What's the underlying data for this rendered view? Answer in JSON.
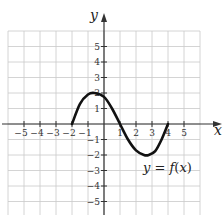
{
  "chart_data": {
    "type": "line",
    "title": "",
    "xlabel": "x",
    "ylabel": "y",
    "xlim": [
      -6,
      6
    ],
    "ylim": [
      -6,
      6
    ],
    "grid": true,
    "x_ticks": [
      -5,
      -4,
      -3,
      -2,
      -1,
      1,
      2,
      3,
      4,
      5
    ],
    "y_ticks": [
      5,
      4,
      3,
      2,
      1,
      -1,
      -2,
      -3,
      -4,
      -5
    ],
    "x_tick_labels": [
      "−5",
      "−4",
      "−3",
      "−2",
      "−1",
      "1",
      "2",
      "3",
      "4",
      "5"
    ],
    "y_tick_labels": [
      "5",
      "4",
      "3",
      "2",
      "1",
      "−1",
      "−2",
      "−3",
      "−4",
      "−5"
    ],
    "series": [
      {
        "name": "y = f(x)",
        "x": [
          -2,
          -1.5,
          -1,
          -0.6,
          0,
          0.5,
          1,
          1.5,
          2,
          2.5,
          2.8,
          3.2,
          3.6,
          4
        ],
        "y": [
          0,
          1.3,
          1.9,
          2.0,
          1.75,
          1.0,
          0,
          -1.0,
          -1.7,
          -2.0,
          -2.0,
          -1.75,
          -1.0,
          0
        ]
      }
    ],
    "annotations": [
      {
        "text": "y = f(x)",
        "x": 3.8,
        "y": -2.7
      }
    ]
  },
  "labels": {
    "x_axis": "x",
    "y_axis": "y",
    "function": "y = f(x)"
  }
}
